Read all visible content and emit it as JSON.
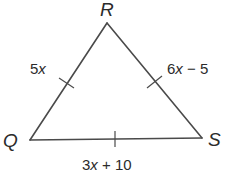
{
  "figure": {
    "type": "triangle",
    "vertices": [
      {
        "id": "R",
        "label": "R"
      },
      {
        "id": "Q",
        "label": "Q"
      },
      {
        "id": "S",
        "label": "S"
      }
    ],
    "sides": [
      {
        "id": "QR",
        "from": "Q",
        "to": "R",
        "coef": "5",
        "var": "x",
        "rest": "",
        "congruence_ticks": 1
      },
      {
        "id": "RS",
        "from": "R",
        "to": "S",
        "coef": "6",
        "var": "x",
        "rest": " − 5",
        "congruence_ticks": 1
      },
      {
        "id": "QS",
        "from": "Q",
        "to": "S",
        "coef": "3",
        "var": "x",
        "rest": " + 10",
        "congruence_ticks": 1
      }
    ]
  }
}
